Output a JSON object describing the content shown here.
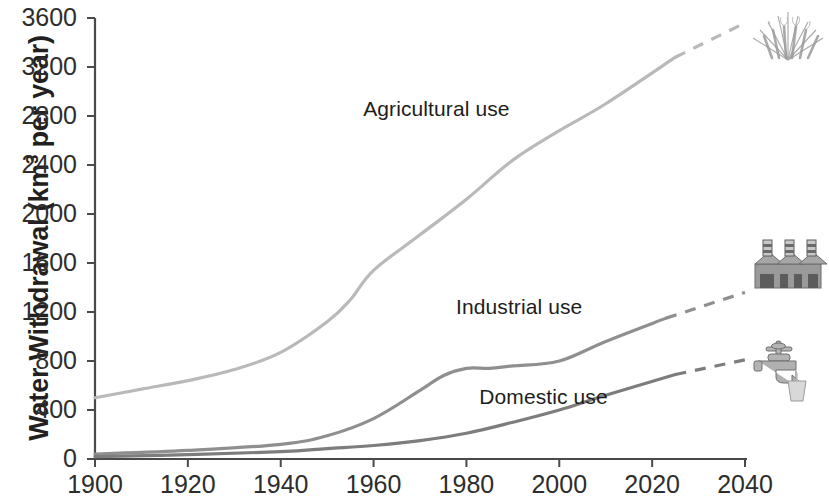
{
  "chart_data": {
    "type": "line",
    "title": "",
    "xlabel": "",
    "ylabel": "Water Withdrawal (km3 per year)",
    "ylabel_prefix": "Water Withdrawal (km",
    "ylabel_sup": "3",
    "ylabel_suffix": " per year)",
    "xlim": [
      1900,
      2040
    ],
    "ylim": [
      0,
      3600
    ],
    "xticks": [
      1900,
      1920,
      1940,
      1960,
      1980,
      2000,
      2020,
      2040
    ],
    "yticks": [
      0,
      400,
      800,
      1200,
      1600,
      2000,
      2400,
      2800,
      3200,
      3600
    ],
    "grid": false,
    "legend_position": "inline-annotations",
    "projection_note": "dashed segments are projections",
    "series": [
      {
        "name": "Agricultural use",
        "color": "#b9b9b9",
        "label_x": 1975,
        "label_y": 2850,
        "icon": "wheat-icon",
        "x": [
          1900,
          1910,
          1920,
          1930,
          1940,
          1950,
          1955,
          1960,
          1970,
          1980,
          1990,
          2000,
          2010,
          2025
        ],
        "values": [
          500,
          570,
          640,
          730,
          870,
          1120,
          1300,
          1540,
          1830,
          2120,
          2440,
          2680,
          2900,
          3280
        ],
        "projection_x": [
          2025,
          2040
        ],
        "projection_values": [
          3280,
          3560
        ]
      },
      {
        "name": "Industrial use",
        "color": "#8f8f8f",
        "label_x": 1995,
        "label_y": 1230,
        "icon": "factory-icon",
        "x": [
          1900,
          1920,
          1940,
          1950,
          1960,
          1970,
          1975,
          1980,
          1985,
          1990,
          2000,
          2010,
          2023
        ],
        "values": [
          40,
          70,
          120,
          190,
          330,
          560,
          680,
          740,
          740,
          760,
          800,
          960,
          1150
        ],
        "projection_x": [
          2023,
          2040
        ],
        "projection_values": [
          1150,
          1360
        ]
      },
      {
        "name": "Domestic use",
        "color": "#7d7d7d",
        "label_x": 2000,
        "label_y": 500,
        "icon": "faucet-icon",
        "x": [
          1900,
          1920,
          1940,
          1950,
          1960,
          1970,
          1980,
          1990,
          2000,
          2010,
          2025
        ],
        "values": [
          20,
          35,
          60,
          85,
          110,
          150,
          210,
          300,
          400,
          520,
          690
        ],
        "projection_x": [
          2025,
          2040
        ],
        "projection_values": [
          690,
          810
        ]
      }
    ]
  },
  "axis": {
    "y_tick_labels": [
      "3600",
      "3200",
      "2800",
      "2400",
      "2000",
      "1600",
      "1200",
      "800",
      "400",
      "0"
    ],
    "x_tick_labels": [
      "1900",
      "1920",
      "1940",
      "1960",
      "1980",
      "2000",
      "2020",
      "2040"
    ]
  },
  "icons": {
    "wheat": "wheat-icon",
    "factory": "factory-icon",
    "faucet": "faucet-icon"
  }
}
